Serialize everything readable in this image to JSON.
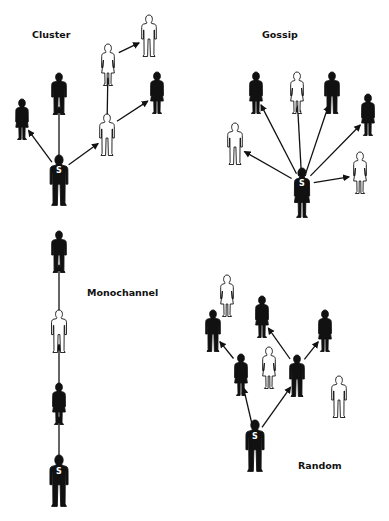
{
  "colors": {
    "ink": "#111111",
    "paper": "#ffffff"
  },
  "source_marker": "S",
  "panels": [
    {
      "id": "cluster",
      "label": "Cluster",
      "people": [
        {
          "id": "s",
          "type": "man",
          "fill": "black",
          "source": true
        },
        {
          "id": "p1",
          "type": "woman",
          "fill": "black"
        },
        {
          "id": "p2",
          "type": "man",
          "fill": "black"
        },
        {
          "id": "p3",
          "type": "man",
          "fill": "white"
        },
        {
          "id": "p4",
          "type": "woman",
          "fill": "white"
        },
        {
          "id": "p5",
          "type": "man",
          "fill": "white"
        },
        {
          "id": "p6",
          "type": "woman",
          "fill": "black"
        }
      ],
      "links": [
        [
          "s",
          "p1"
        ],
        [
          "s",
          "p2"
        ],
        [
          "s",
          "p3"
        ],
        [
          "p3",
          "p4"
        ],
        [
          "p3",
          "p6"
        ],
        [
          "p4",
          "p5"
        ]
      ]
    },
    {
      "id": "gossip",
      "label": "Gossip",
      "people": [
        {
          "id": "s",
          "type": "woman",
          "fill": "black",
          "source": true
        },
        {
          "id": "p1",
          "type": "man",
          "fill": "white"
        },
        {
          "id": "p2",
          "type": "woman",
          "fill": "black"
        },
        {
          "id": "p3",
          "type": "woman",
          "fill": "white"
        },
        {
          "id": "p4",
          "type": "man",
          "fill": "black"
        },
        {
          "id": "p5",
          "type": "woman",
          "fill": "black"
        },
        {
          "id": "p6",
          "type": "woman",
          "fill": "white"
        }
      ],
      "links": [
        [
          "s",
          "p1"
        ],
        [
          "s",
          "p2"
        ],
        [
          "s",
          "p3"
        ],
        [
          "s",
          "p4"
        ],
        [
          "s",
          "p5"
        ],
        [
          "s",
          "p6"
        ]
      ]
    },
    {
      "id": "monochannel",
      "label": "Monochannel",
      "people": [
        {
          "id": "s",
          "type": "man",
          "fill": "black",
          "source": true
        },
        {
          "id": "p1",
          "type": "woman",
          "fill": "black"
        },
        {
          "id": "p2",
          "type": "man",
          "fill": "white"
        },
        {
          "id": "p3",
          "type": "man",
          "fill": "black"
        }
      ],
      "links": [
        [
          "s",
          "p1"
        ],
        [
          "p1",
          "p2"
        ],
        [
          "p2",
          "p3"
        ]
      ]
    },
    {
      "id": "random",
      "label": "Random",
      "people": [
        {
          "id": "s",
          "type": "man",
          "fill": "black",
          "source": true
        },
        {
          "id": "p1",
          "type": "woman",
          "fill": "black"
        },
        {
          "id": "p2",
          "type": "man",
          "fill": "black"
        },
        {
          "id": "p3",
          "type": "man",
          "fill": "black"
        },
        {
          "id": "p4",
          "type": "woman",
          "fill": "white"
        },
        {
          "id": "p5",
          "type": "woman",
          "fill": "black"
        },
        {
          "id": "p6",
          "type": "woman",
          "fill": "white"
        },
        {
          "id": "p7",
          "type": "woman",
          "fill": "black"
        },
        {
          "id": "p8",
          "type": "man",
          "fill": "white"
        }
      ],
      "links": [
        [
          "s",
          "p1"
        ],
        [
          "s",
          "p2"
        ],
        [
          "p1",
          "p3"
        ],
        [
          "p2",
          "p5"
        ],
        [
          "p2",
          "p7"
        ]
      ]
    }
  ]
}
